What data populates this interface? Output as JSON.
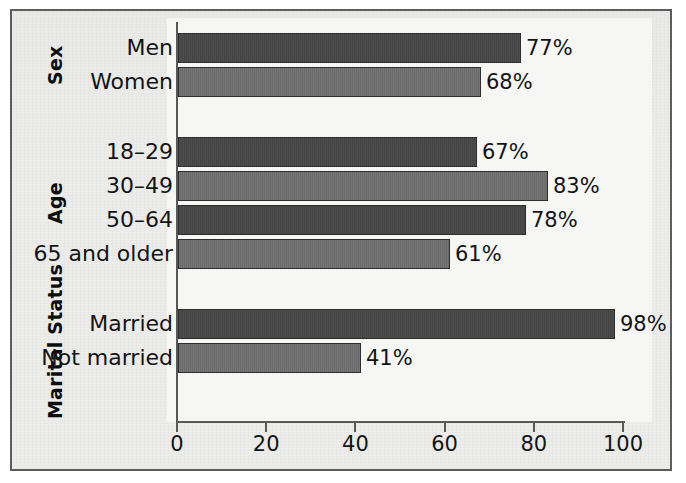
{
  "chart_data": {
    "type": "bar",
    "orientation": "horizontal",
    "title": "",
    "subtitle": "",
    "xlabel": "",
    "ylabel": "",
    "xlim": [
      0,
      100
    ],
    "xticks": [
      0,
      20,
      40,
      60,
      80,
      100
    ],
    "xtick_labels": [
      "0",
      "20",
      "40",
      "60",
      "80",
      "100"
    ],
    "grid": false,
    "legend": false,
    "value_label_suffix": "%",
    "groups": [
      {
        "name": "Sex",
        "categories": [
          "Men",
          "Women"
        ],
        "values": [
          77,
          68
        ],
        "value_labels": [
          "77%",
          "68%"
        ],
        "shades": [
          "dark",
          "light"
        ]
      },
      {
        "name": "Age",
        "categories": [
          "18–29",
          "30–49",
          "50–64",
          "65 and older"
        ],
        "values": [
          67,
          83,
          78,
          61
        ],
        "value_labels": [
          "67%",
          "83%",
          "78%",
          "61%"
        ],
        "shades": [
          "dark",
          "light",
          "dark",
          "light"
        ]
      },
      {
        "name": "Marital Status",
        "categories": [
          "Married",
          "Not married"
        ],
        "values": [
          98,
          41
        ],
        "value_labels": [
          "98%",
          "41%"
        ],
        "shades": [
          "dark",
          "light"
        ]
      }
    ],
    "categories": [
      "Men",
      "Women",
      "18–29",
      "30–49",
      "50–64",
      "65 and older",
      "Married",
      "Not married"
    ],
    "values": [
      77,
      68,
      67,
      83,
      78,
      61,
      98,
      41
    ],
    "colors": {
      "bar_dark": "#474747",
      "bar_light": "#6f6f6f",
      "bar_outline": "#2e2e2e",
      "axis": "#585858",
      "text": "#141414",
      "plot_background": "#f6f6f5",
      "page_background": "#ececeb",
      "frame_border": "#5d5d5d"
    }
  }
}
